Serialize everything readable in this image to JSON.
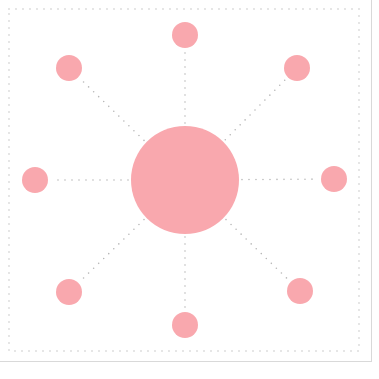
{
  "diagram": {
    "type": "radial-hub-spoke",
    "colors": {
      "node_fill": "#f9a8ae",
      "spoke_stroke": "#b8b8b8",
      "border_dots": "#c4c4c4",
      "frame_line": "#d9d9d9",
      "background": "#ffffff"
    },
    "border": {
      "x": 9,
      "y": 9,
      "width": 350,
      "height": 342
    },
    "hub": {
      "id": "center",
      "cx": 185,
      "cy": 180,
      "r": 54
    },
    "nodes": [
      {
        "id": "top",
        "cx": 185,
        "cy": 35,
        "r": 13
      },
      {
        "id": "top-right",
        "cx": 297,
        "cy": 68,
        "r": 13
      },
      {
        "id": "right",
        "cx": 334,
        "cy": 179,
        "r": 13
      },
      {
        "id": "bottom-right",
        "cx": 300,
        "cy": 291,
        "r": 13
      },
      {
        "id": "bottom",
        "cx": 185,
        "cy": 325,
        "r": 13
      },
      {
        "id": "bottom-left",
        "cx": 69,
        "cy": 292,
        "r": 13
      },
      {
        "id": "left",
        "cx": 35,
        "cy": 180,
        "r": 13
      },
      {
        "id": "top-left",
        "cx": 69,
        "cy": 68,
        "r": 13
      }
    ]
  }
}
